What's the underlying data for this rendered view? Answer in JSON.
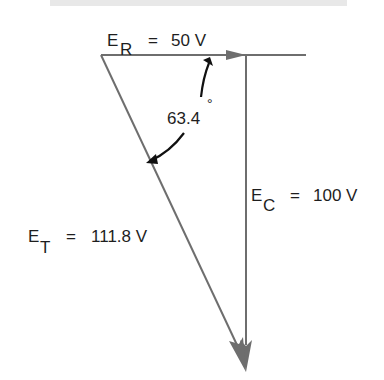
{
  "diagram": {
    "type": "phasor-diagram",
    "colors": {
      "vector": "#6e6e6e",
      "text": "#1e1e1e",
      "annotation_arrow": "#111111"
    },
    "vectors": {
      "resistive": {
        "symbol": "E",
        "subscript": "R",
        "equals": "=",
        "value": "50 V"
      },
      "capacitive": {
        "symbol": "E",
        "subscript": "C",
        "equals": "=",
        "value": "100 V"
      },
      "total": {
        "symbol": "E",
        "subscript": "T",
        "equals": "=",
        "value": "111.8 V"
      }
    },
    "angle": {
      "value": "63.4",
      "unit": "°"
    }
  }
}
